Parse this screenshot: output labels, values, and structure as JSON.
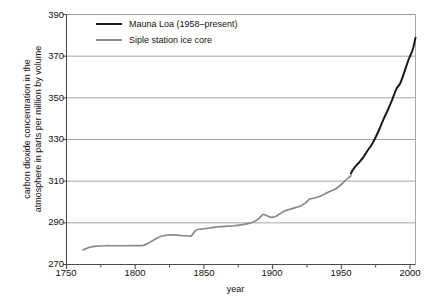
{
  "chart_data": {
    "type": "line",
    "title": "",
    "xlabel": "year",
    "ylabel": "carbon dioxide concentration in the\natmosphere in parts per million by volume",
    "xlim": [
      1750,
      2004
    ],
    "ylim": [
      270,
      390
    ],
    "xticks": [
      1750,
      1800,
      1850,
      1900,
      1950,
      2000
    ],
    "xticks_minor": [
      1775,
      1825,
      1875,
      1925,
      1975
    ],
    "yticks": [
      270,
      290,
      310,
      330,
      350,
      370,
      390
    ],
    "grid": "horizontal",
    "legend_position": "top-left",
    "colors": {
      "mauna_loa": "#1a1a1a",
      "siple": "#8a8a8a",
      "grid": "#9b9b9b",
      "axis": "#4d4d4d",
      "background": "#ffffff"
    },
    "series": [
      {
        "name": "Siple station ice core",
        "color": "#8a8a8a",
        "x": [
          1762,
          1767,
          1772,
          1778,
          1784,
          1792,
          1800,
          1806,
          1810,
          1814,
          1818,
          1822,
          1826,
          1830,
          1834,
          1838,
          1841,
          1844,
          1848,
          1852,
          1857,
          1862,
          1867,
          1872,
          1877,
          1882,
          1886,
          1890,
          1893,
          1896,
          1899,
          1902,
          1905,
          1908,
          1912,
          1916,
          1920,
          1924,
          1927,
          1930,
          1934,
          1938,
          1942,
          1946,
          1950,
          1953,
          1956,
          1957
        ],
        "y": [
          277.0,
          278.3,
          278.8,
          279.0,
          279.0,
          279.0,
          279.1,
          279.2,
          280.4,
          282.0,
          283.3,
          284.0,
          284.2,
          284.1,
          283.9,
          283.8,
          283.8,
          286.4,
          287.0,
          287.3,
          287.8,
          288.2,
          288.4,
          288.6,
          289.0,
          289.6,
          290.4,
          292.0,
          294.0,
          293.4,
          292.6,
          293.0,
          294.2,
          295.4,
          296.4,
          297.2,
          298.0,
          299.6,
          301.4,
          301.8,
          302.6,
          303.8,
          305.2,
          306.4,
          308.4,
          310.4,
          312.0,
          312.6
        ]
      },
      {
        "name": "Mauna Loa (1958–present)",
        "color": "#1a1a1a",
        "x": [
          1957,
          1958,
          1960,
          1963,
          1966,
          1969,
          1972,
          1975,
          1978,
          1981,
          1984,
          1987,
          1990,
          1993,
          1996,
          1999,
          2002,
          2004
        ],
        "y": [
          313.6,
          315.0,
          316.9,
          319.0,
          321.4,
          324.6,
          327.4,
          331.1,
          335.4,
          340.1,
          344.4,
          349.0,
          354.2,
          357.1,
          362.6,
          368.4,
          373.2,
          378.8
        ]
      }
    ],
    "annotations": []
  },
  "legend": {
    "entries": [
      {
        "label": "Mauna Loa (1958–present)",
        "style": "thick",
        "icon": "line-swatch-black"
      },
      {
        "label": "Siple station ice core",
        "style": "thin",
        "icon": "line-swatch-gray"
      }
    ]
  },
  "axes": {
    "x_label": "year",
    "y_label": "carbon dioxide concentration in the\natmosphere in parts per million by volume",
    "x_tick_labels": [
      "1750",
      "1800",
      "1850",
      "1900",
      "1950",
      "2000"
    ],
    "y_tick_labels": [
      "270",
      "290",
      "310",
      "330",
      "350",
      "370",
      "390"
    ]
  }
}
